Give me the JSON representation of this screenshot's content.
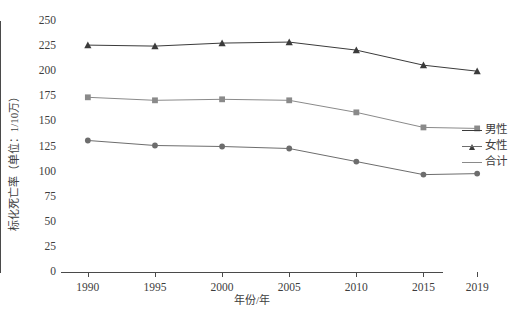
{
  "chart_data": {
    "type": "line",
    "title": "",
    "xlabel": "年份/年",
    "ylabel": "标化死亡率（单位：1/10万）",
    "categories": [
      "1990",
      "1995",
      "2000",
      "2005",
      "2010",
      "2015",
      "2019"
    ],
    "x": [
      1990,
      1995,
      2000,
      2005,
      2010,
      2015,
      2019
    ],
    "xlim": [
      1988,
      2021
    ],
    "ylim": [
      0,
      250
    ],
    "yticks": [
      0,
      25,
      50,
      75,
      100,
      125,
      150,
      175,
      200,
      225,
      250
    ],
    "grid": false,
    "legend_position": "right",
    "series": [
      {
        "name": "男性",
        "marker": "triangle",
        "color": "#3b3b3b",
        "values": [
          226,
          225,
          228,
          229,
          221,
          206,
          200
        ]
      },
      {
        "name": "女性",
        "marker": "circle",
        "color": "#6d6d6d",
        "values": [
          131,
          126,
          125,
          123,
          110,
          97,
          98
        ]
      },
      {
        "name": "合计",
        "marker": "square",
        "color": "#8a8a8a",
        "values": [
          174,
          171,
          172,
          171,
          159,
          144,
          143
        ]
      }
    ]
  },
  "legend": {
    "items": [
      {
        "label": "男性",
        "marker": "triangle",
        "color": "#3b3b3b"
      },
      {
        "label": "女性",
        "marker": "circle",
        "color": "#6d6d6d"
      },
      {
        "label": "合计",
        "marker": "square",
        "color": "#8a8a8a"
      }
    ]
  },
  "axes": {
    "y_title": "标化死亡率（单位：1/10万）",
    "x_title": "年份/年",
    "y_tick_labels": [
      "250",
      "225",
      "200",
      "175",
      "150",
      "125",
      "100",
      "75",
      "50",
      "25",
      "0"
    ],
    "x_tick_labels": [
      "1990",
      "1995",
      "2000",
      "2005",
      "2010",
      "2015",
      "2019"
    ]
  }
}
